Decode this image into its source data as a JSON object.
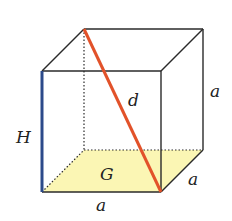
{
  "diagram": {
    "type": "cube",
    "labels": {
      "height": "H",
      "base": "G",
      "diagonal": "d",
      "edge_bottom": "a",
      "edge_depth": "a",
      "edge_right": "a"
    },
    "colors": {
      "edge": "#2a2a2a",
      "diagonal": "#e2522a",
      "height_edge": "#2c4a8a",
      "base_fill": "#fbf6b4"
    }
  }
}
